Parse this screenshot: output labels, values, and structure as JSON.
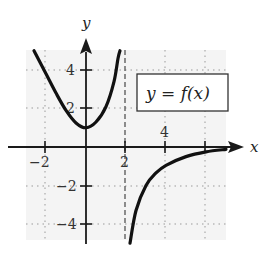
{
  "chart_data": {
    "type": "line",
    "title": "",
    "xlabel": "x",
    "ylabel": "y",
    "xlim": [
      -3,
      7
    ],
    "ylim": [
      -5,
      5
    ],
    "x_ticks": [
      -2,
      2,
      4,
      6
    ],
    "x_tick_labels": [
      "−2",
      "2",
      "4",
      ""
    ],
    "y_ticks": [
      -4,
      -2,
      2,
      4
    ],
    "y_tick_labels": [
      "−4",
      "−2",
      "2",
      "4"
    ],
    "grid": true,
    "grid_style": "dotted",
    "legend": {
      "text": "y = f(x)",
      "position": "upper-right",
      "boxed": true
    },
    "asymptotes": [
      {
        "type": "vertical",
        "x": 2,
        "style": "dashed"
      }
    ],
    "series": [
      {
        "name": "f(x) left branch (x < 2)",
        "points": [
          [
            -2.6,
            5.0
          ],
          [
            -2,
            3.8
          ],
          [
            -1.5,
            2.8
          ],
          [
            -1,
            1.9
          ],
          [
            -0.5,
            1.25
          ],
          [
            0,
            1.0
          ],
          [
            0.5,
            1.3
          ],
          [
            1,
            2.1
          ],
          [
            1.4,
            3.4
          ],
          [
            1.6,
            4.6
          ],
          [
            1.7,
            5.0
          ]
        ]
      },
      {
        "name": "f(x) right branch (x > 2)",
        "points": [
          [
            2.2,
            -5.0
          ],
          [
            2.5,
            -3.3
          ],
          [
            3,
            -2.0
          ],
          [
            3.5,
            -1.35
          ],
          [
            4,
            -0.95
          ],
          [
            5,
            -0.5
          ],
          [
            6,
            -0.25
          ],
          [
            7,
            -0.12
          ]
        ]
      }
    ]
  },
  "labels": {
    "x_axis": "x",
    "y_axis": "y",
    "legend": "y = f(x)",
    "xticks": {
      "m2": "−2",
      "p2": "2",
      "p4": "4"
    },
    "yticks": {
      "p4": "4",
      "p2": "2",
      "m2": "−2",
      "m4": "−4"
    }
  },
  "colors": {
    "curve": "#111111",
    "axis": "#1a1a1a",
    "grid": "#9a9a9a",
    "plot_bg": "#f4f4f4"
  }
}
